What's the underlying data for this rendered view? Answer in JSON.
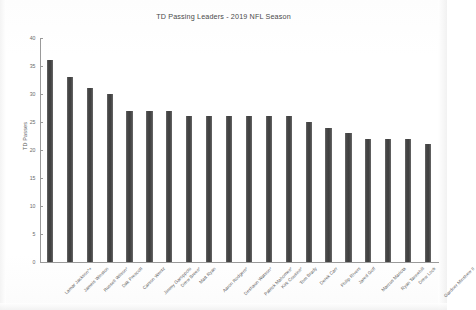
{
  "chart_data": {
    "type": "bar",
    "title": "TD Passing Leaders - 2019 NFL Season",
    "xlabel": "",
    "ylabel": "TD Passes",
    "ylim": [
      0,
      40
    ],
    "yticks": [
      0,
      5,
      10,
      15,
      20,
      25,
      30,
      35,
      40
    ],
    "grid": false,
    "legend": null,
    "bar_color": "#4f4f4f",
    "categories": [
      "Lamar Jackson*+",
      "Jameis Winston",
      "Russell Wilson*",
      "Dak Prescott",
      "Carson Wentz",
      "Jimmy Garoppolo",
      "Drew Brees*",
      "Matt Ryan",
      "Aaron Rodgers*",
      "Deshaun Watson*",
      "Patrick Mahomes*",
      "Kirk Cousins*",
      "Tom Brady",
      "Derek Carr",
      "Philip Rivers",
      "Jared Goff",
      "Marcus Mariota",
      "Ryan Tannehill",
      "Drew Lock",
      "Gardner Minshew II"
    ],
    "values": [
      36,
      33,
      31,
      30,
      27,
      27,
      27,
      26,
      26,
      26,
      26,
      26,
      26,
      25,
      24,
      23,
      22,
      22,
      22,
      21
    ]
  }
}
